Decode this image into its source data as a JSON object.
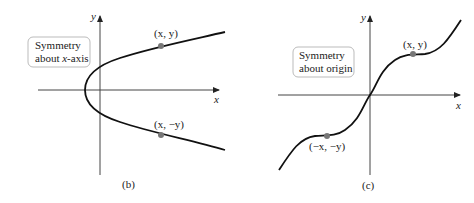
{
  "panels": [
    {
      "id": "b",
      "caption": "(b)",
      "box_line1": "Symmetry",
      "box_line2_prefix": "about ",
      "box_line2_var": "x",
      "box_line2_suffix": "-axis",
      "axis_x_label": "x",
      "axis_y_label": "y",
      "point_upper_label": "(x, y)",
      "point_lower_label": "(x, −y)",
      "curve": "parabola opening right"
    },
    {
      "id": "c",
      "caption": "(c)",
      "box_line1": "Symmetry",
      "box_line2": "about origin",
      "axis_x_label": "x",
      "axis_y_label": "y",
      "point_upper_label": "(x, y)",
      "point_lower_label": "(−x, −y)",
      "curve": "odd cubic-like curve"
    }
  ],
  "colors": {
    "curve": "#111111",
    "axis": "#444444",
    "point": "#777777",
    "box_border": "#bbbbbb"
  }
}
